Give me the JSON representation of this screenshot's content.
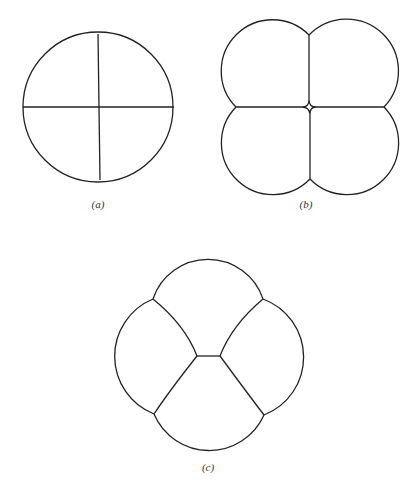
{
  "figure": {
    "panels": [
      {
        "id": "a",
        "label": "(a)",
        "description": "Circle divided into four quadrants by two perpendicular lines"
      },
      {
        "id": "b",
        "label": "(b)",
        "description": "Four rounded cells arranged 2x2 with a small diamond-shaped gap at the center"
      },
      {
        "id": "c",
        "label": "(c)",
        "description": "Four rounded cells in tetrahedral-like arrangement with a short central edge"
      }
    ],
    "stroke_color": "#222222",
    "background": "#ffffff"
  }
}
